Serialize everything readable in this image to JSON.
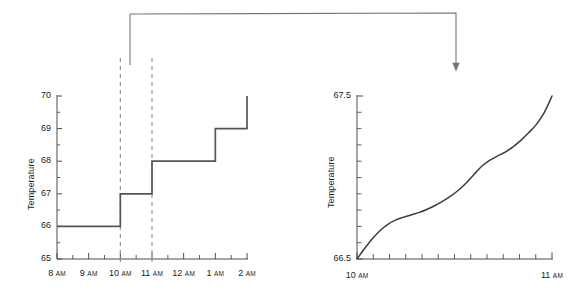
{
  "figure": {
    "background_color": "#ffffff",
    "line_color": "#555555",
    "dashed_color": "#8c8c8c",
    "axis_color": "#4d4d4d",
    "callout_color": "#777777"
  },
  "annotations": {
    "callout_name": "zoom-callout-arrow",
    "callout_from_x": 130,
    "callout_to_x": 456,
    "callout_top_y": 13,
    "callout_arrow_tip_y": 71
  },
  "chart_data": [
    {
      "id": "left-step-chart",
      "type": "line",
      "step": "post",
      "title": "",
      "xlabel": "",
      "ylabel": "Temperature",
      "xlim": [
        8,
        14
      ],
      "ylim": [
        65,
        70
      ],
      "grid": false,
      "legend": null,
      "x_tick_labels": [
        {
          "value": 8,
          "hour": "8",
          "suffix": "AM"
        },
        {
          "value": 9,
          "hour": "9",
          "suffix": "AM"
        },
        {
          "value": 10,
          "hour": "10",
          "suffix": "AM"
        },
        {
          "value": 11,
          "hour": "11",
          "suffix": "AM"
        },
        {
          "value": 12,
          "hour": "12",
          "suffix": "AM"
        },
        {
          "value": 13,
          "hour": "1",
          "suffix": "AM"
        },
        {
          "value": 14,
          "hour": "2",
          "suffix": "AM"
        }
      ],
      "x_minor_tick_interval": 0.5,
      "y_tick_labels": [
        "70",
        "69",
        "68",
        "67",
        "66",
        "65"
      ],
      "y_tick_values": [
        70,
        69,
        68,
        67,
        66,
        65
      ],
      "y_minor_tick_interval": 0.5,
      "x": [
        8,
        10,
        11,
        13,
        14
      ],
      "values": [
        66,
        67,
        68,
        69,
        70
      ],
      "final_riser_top": 70,
      "highlight_region": {
        "label": "dashed-zoom-region",
        "x_start": 10,
        "x_end": 11,
        "style": "dashed"
      }
    },
    {
      "id": "right-detail-chart",
      "type": "line",
      "title": "",
      "xlabel": "",
      "ylabel": "Temperature",
      "xlim": [
        10,
        11
      ],
      "ylim": [
        66.5,
        67.5
      ],
      "grid": false,
      "legend": null,
      "x_tick_labels": [
        {
          "value": 10,
          "hour": "10",
          "suffix": "AM"
        },
        {
          "value": 11,
          "hour": "11",
          "suffix": "AM"
        }
      ],
      "x_minor_tick_count": 12,
      "y_tick_labels": [
        "67.5",
        "66.5"
      ],
      "y_tick_values": [
        67.5,
        66.5
      ],
      "y_minor_tick_count": 10,
      "x": [
        10.0,
        10.04,
        10.08,
        10.12,
        10.16,
        10.2,
        10.24,
        10.28,
        10.32,
        10.36,
        10.4,
        10.44,
        10.48,
        10.52,
        10.56,
        10.6,
        10.64,
        10.68,
        10.72,
        10.76,
        10.8,
        10.84,
        10.88,
        10.92,
        10.96,
        11.0
      ],
      "values": [
        66.5,
        66.566,
        66.626,
        66.676,
        66.714,
        66.74,
        66.757,
        66.771,
        66.786,
        66.805,
        66.828,
        66.855,
        66.886,
        66.922,
        66.966,
        67.019,
        67.069,
        67.105,
        67.131,
        67.156,
        67.188,
        67.228,
        67.274,
        67.326,
        67.398,
        67.5
      ]
    }
  ]
}
